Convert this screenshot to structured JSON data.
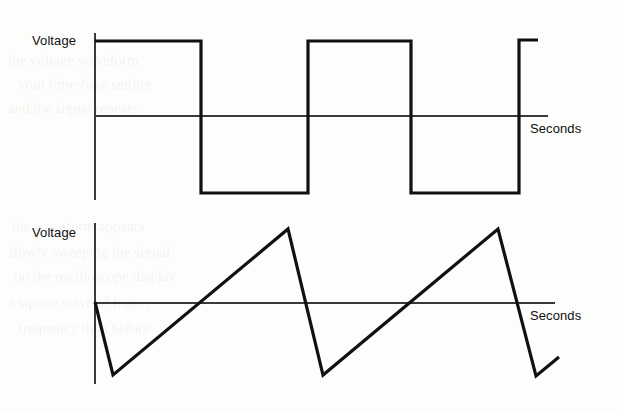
{
  "figure": {
    "background_color": "#fdfdfc",
    "stroke_color": "#111111",
    "axis_color": "#3a3a3a",
    "wave_stroke_width": 3,
    "axis_stroke_width": 1.2
  },
  "plots": [
    {
      "id": "square-wave",
      "y_axis_label": "Voltage",
      "x_axis_label": "Seconds",
      "waveform_type": "square",
      "y_axis": {
        "x": 95,
        "y_top": 33,
        "y_bottom": 200
      },
      "x_axis": {
        "y": 116,
        "x_start": 95,
        "x_end": 548
      },
      "label_positions": {
        "voltage": {
          "x": 32,
          "y": 45
        },
        "seconds": {
          "x": 530,
          "y": 133
        }
      },
      "levels": {
        "high_y": 41,
        "low_y": 193
      },
      "path": "M95,41 L201,41 L201,193 L308,193 L308,41 L411,41 L411,193 L519,193 L519,40 L538,40",
      "transitions_x": [
        95,
        201,
        308,
        411,
        519,
        538
      ]
    },
    {
      "id": "sawtooth-wave",
      "y_axis_label": "Voltage",
      "x_axis_label": "Seconds",
      "waveform_type": "sawtooth",
      "y_axis": {
        "x": 95,
        "y_top": 223,
        "y_bottom": 384
      },
      "x_axis": {
        "y": 303,
        "x_start": 95,
        "x_end": 555
      },
      "label_positions": {
        "voltage": {
          "x": 32,
          "y": 237
        },
        "seconds": {
          "x": 530,
          "y": 320
        }
      },
      "levels": {
        "peak_y": 229,
        "trough_y": 375
      },
      "path": "M95,302 L113,375 L288,229 L323,375 L498,229 L536,376 L559,357",
      "vertices": [
        {
          "x": 95,
          "y": 302
        },
        {
          "x": 113,
          "y": 375
        },
        {
          "x": 288,
          "y": 229
        },
        {
          "x": 323,
          "y": 375
        },
        {
          "x": 498,
          "y": 229
        },
        {
          "x": 536,
          "y": 376
        },
        {
          "x": 559,
          "y": 357
        }
      ]
    }
  ],
  "chart_data": {
    "type": "line",
    "xlabel": "Seconds",
    "ylabel": "Voltage",
    "grid": false,
    "legend_position": "none",
    "series": [
      {
        "name": "Square wave",
        "waveform": "square",
        "description": "Bipolar square wave alternating between a positive high level and a negative low level with abrupt vertical transitions",
        "amplitude_levels": {
          "high": 1,
          "low": -1
        },
        "points": [
          {
            "x": 0,
            "y": 1
          },
          {
            "x": 0.25,
            "y": 1
          },
          {
            "x": 0.25,
            "y": -1
          },
          {
            "x": 0.5,
            "y": -1
          },
          {
            "x": 0.5,
            "y": 1
          },
          {
            "x": 0.75,
            "y": 1
          },
          {
            "x": 0.75,
            "y": -1
          },
          {
            "x": 1.0,
            "y": -1
          },
          {
            "x": 1.0,
            "y": 1
          },
          {
            "x": 1.04,
            "y": 1
          }
        ]
      },
      {
        "name": "Sawtooth wave",
        "waveform": "sawtooth",
        "description": "Sawtooth ramp rising linearly from the negative trough to the positive peak then dropping sharply back to the trough",
        "amplitude_levels": {
          "peak": 1,
          "trough": -1
        },
        "points": [
          {
            "x": 0,
            "y": 0
          },
          {
            "x": 0.04,
            "y": -1
          },
          {
            "x": 0.42,
            "y": 1
          },
          {
            "x": 0.5,
            "y": -1
          },
          {
            "x": 0.88,
            "y": 1
          },
          {
            "x": 0.96,
            "y": -1
          },
          {
            "x": 1.0,
            "y": -0.74
          }
        ]
      }
    ],
    "annotations": [
      {
        "text": "Voltage",
        "role": "y-axis-label",
        "plot": "square-wave"
      },
      {
        "text": "Seconds",
        "role": "x-axis-label",
        "plot": "square-wave"
      },
      {
        "text": "Voltage",
        "role": "y-axis-label",
        "plot": "sawtooth-wave"
      },
      {
        "text": "Seconds",
        "role": "x-axis-label",
        "plot": "sawtooth-wave"
      }
    ]
  }
}
